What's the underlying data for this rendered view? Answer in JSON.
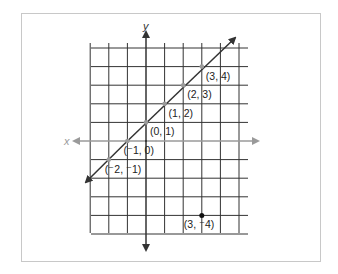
{
  "figure": {
    "axes": {
      "x_label": "x",
      "y_label": "y"
    },
    "colors": {
      "grid": "#333333",
      "line": "#333333",
      "x_axis": "#9a9a9a",
      "y_axis": "#333333",
      "points_on_line": "#9a9a9a",
      "point_off_line": "#111111",
      "frame": "#c8c8c8"
    },
    "grid": {
      "x_min": -5,
      "x_max": 5,
      "y_min": -5,
      "y_max": 5
    },
    "line_equation": "y = x + 1",
    "points_on_line": [
      {
        "label": "(⁻2, ⁻1)",
        "x": -2,
        "y": -1
      },
      {
        "label": "(⁻1, 0)",
        "x": -1,
        "y": 0
      },
      {
        "label": "(0, 1)",
        "x": 0,
        "y": 1
      },
      {
        "label": "(1, 2)",
        "x": 1,
        "y": 2
      },
      {
        "label": "(2, 3)",
        "x": 2,
        "y": 3
      },
      {
        "label": "(3, 4)",
        "x": 3,
        "y": 4
      }
    ],
    "point_off_line": {
      "label": "(3, ⁻4)",
      "x": 3,
      "y": -4
    }
  }
}
